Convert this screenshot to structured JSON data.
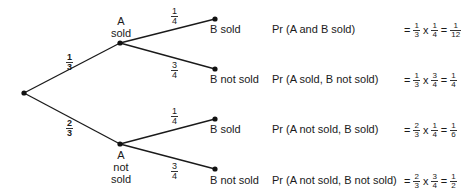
{
  "diagram": {
    "type": "probability-tree",
    "root": {
      "x": 24,
      "y": 93
    },
    "first_level": [
      {
        "label_line1": "A",
        "label_line2": "sold",
        "label_line3": "",
        "prob": {
          "num": "1",
          "den": "3"
        }
      },
      {
        "label_line1": "A",
        "label_line2": "not",
        "label_line3": "sold",
        "prob": {
          "num": "2",
          "den": "3"
        }
      }
    ],
    "second_level": [
      {
        "label": "B sold",
        "prob": {
          "num": "1",
          "den": "4"
        }
      },
      {
        "label": "B not sold",
        "prob": {
          "num": "3",
          "den": "4"
        }
      },
      {
        "label": "B sold",
        "prob": {
          "num": "1",
          "den": "4"
        }
      },
      {
        "label": "B not sold",
        "prob": {
          "num": "3",
          "den": "4"
        }
      }
    ],
    "outcomes": [
      {
        "event": "Pr (A and B sold)",
        "f1": {
          "num": "1",
          "den": "3"
        },
        "f2": {
          "num": "1",
          "den": "4"
        },
        "result": {
          "num": "1",
          "den": "12"
        }
      },
      {
        "event": "Pr (A sold, B not sold)",
        "f1": {
          "num": "1",
          "den": "3"
        },
        "f2": {
          "num": "3",
          "den": "4"
        },
        "result": {
          "num": "1",
          "den": "4"
        }
      },
      {
        "event": "Pr (A not sold, B sold)",
        "f1": {
          "num": "2",
          "den": "3"
        },
        "f2": {
          "num": "1",
          "den": "4"
        },
        "result": {
          "num": "1",
          "den": "6"
        }
      },
      {
        "event": "Pr (A not sold, B not sold)",
        "f1": {
          "num": "2",
          "den": "3"
        },
        "f2": {
          "num": "3",
          "den": "4"
        },
        "result": {
          "num": "1",
          "den": "2"
        }
      }
    ],
    "symbols": {
      "equals": "=",
      "times": "x"
    }
  }
}
